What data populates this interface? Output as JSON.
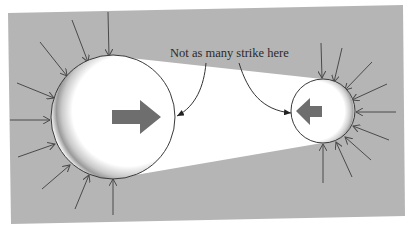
{
  "figure": {
    "annotation": "Not as many strike here",
    "colors": {
      "page": "#ffffff",
      "panel": "#b5b5b5",
      "shadow_wedge": "#ffffff",
      "sphere_fill": "#ffffff",
      "sphere_outline": "#3a3a3a",
      "impact_arrow": "#4a4a4a",
      "motion_arrow": "#6e6e6e",
      "text": "#2a2a2a"
    },
    "large_sphere": {
      "label": "large particle",
      "motion_direction": "right"
    },
    "small_sphere": {
      "label": "small particle",
      "motion_direction": "left"
    }
  }
}
